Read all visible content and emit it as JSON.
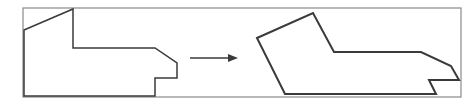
{
  "diagram": {
    "colors": {
      "background": "#ffffff",
      "frame": "#8a8a8a",
      "shape": "#3a3a3a",
      "arrow": "#3a3a3a"
    },
    "frame": {
      "x": 23,
      "y": 8,
      "width": 438,
      "height": 89
    },
    "left_shape": {
      "points": "24,30 73,9 73,48 155,48 177,63 177,78 155,78 155,96 24,96"
    },
    "arrow": {
      "x1": 190,
      "y1": 58,
      "x2": 228,
      "y2": 58,
      "head": "228,54 238,58 228,62"
    },
    "right_shape": {
      "points": "257,38 313,13 334,52 421,52 451,66 459,80 429,80 436,94 285,94"
    }
  }
}
